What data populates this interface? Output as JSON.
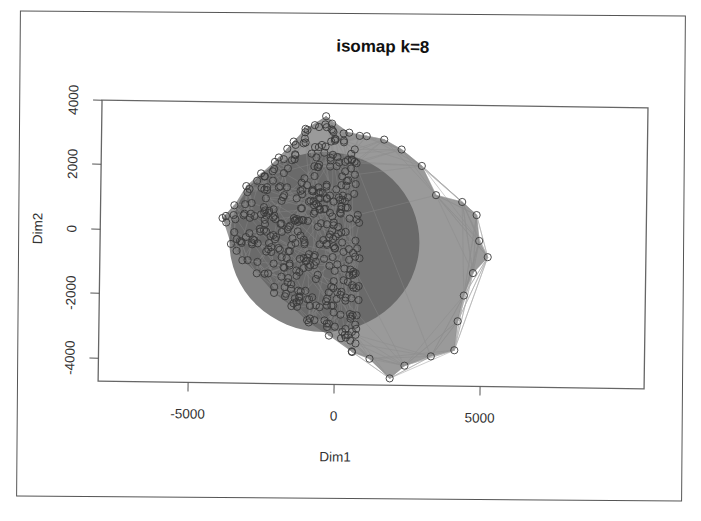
{
  "chart_data": {
    "type": "scatter",
    "subtype": "network-graph-scatter",
    "title": "isomap k=8",
    "xlabel": "Dim1",
    "ylabel": "Dim2",
    "xlim": [
      -8000,
      10000
    ],
    "ylim": [
      -4700,
      4100
    ],
    "x_ticks": [
      -5000,
      0,
      5000
    ],
    "x_tick_labels": [
      "-5000",
      "0",
      "5000"
    ],
    "y_ticks": [
      -4000,
      -2000,
      0,
      2000,
      4000
    ],
    "y_tick_labels": [
      "-4000",
      "-2000",
      "0",
      "2000",
      "4000"
    ],
    "grid": false,
    "legend": null,
    "point_style": "open circles, dark gray",
    "edge_style": "gray line segments connecting k=8 nearest neighbors",
    "hull_points": [
      {
        "x": -3900,
        "y": 400
      },
      {
        "x": -3500,
        "y": 800
      },
      {
        "x": -3100,
        "y": 1400
      },
      {
        "x": -2600,
        "y": 1800
      },
      {
        "x": -2000,
        "y": 2300
      },
      {
        "x": -1500,
        "y": 2800
      },
      {
        "x": -1100,
        "y": 3200
      },
      {
        "x": -400,
        "y": 3600
      },
      {
        "x": 400,
        "y": 3100
      },
      {
        "x": 1000,
        "y": 3000
      },
      {
        "x": 1600,
        "y": 2900
      },
      {
        "x": 2200,
        "y": 2600
      },
      {
        "x": 2900,
        "y": 2100
      },
      {
        "x": 3400,
        "y": 1200
      },
      {
        "x": 4300,
        "y": 1000
      },
      {
        "x": 4800,
        "y": 600
      },
      {
        "x": 4900,
        "y": -200
      },
      {
        "x": 5200,
        "y": -700
      },
      {
        "x": 4700,
        "y": -1200
      },
      {
        "x": 4400,
        "y": -1900
      },
      {
        "x": 4200,
        "y": -2700
      },
      {
        "x": 4100,
        "y": -3600
      },
      {
        "x": 3300,
        "y": -3800
      },
      {
        "x": 2400,
        "y": -4100
      },
      {
        "x": 1900,
        "y": -4500
      },
      {
        "x": 1200,
        "y": -3900
      },
      {
        "x": 600,
        "y": -3700
      },
      {
        "x": -200,
        "y": -3200
      },
      {
        "x": -900,
        "y": -2800
      },
      {
        "x": -1500,
        "y": -2300
      },
      {
        "x": -2100,
        "y": -1900
      },
      {
        "x": -2700,
        "y": -1300
      },
      {
        "x": -3200,
        "y": -900
      },
      {
        "x": -3600,
        "y": -400
      }
    ],
    "n_points_approx": 400,
    "density_note": "dense dark core centered near (0, 0); sparser edges toward lower-right"
  },
  "plot": {
    "title": "isomap k=8",
    "xlabel": "Dim1",
    "ylabel": "Dim2",
    "x_tick_labels": [
      "-5000",
      "0",
      "5000"
    ],
    "y_tick_labels": [
      "4000",
      "2000",
      "0",
      "-2000",
      "-4000"
    ]
  },
  "colors": {
    "background": "#ffffff",
    "axes": "#555555",
    "edge": "#8a8a8a",
    "core": "#5a5a5a",
    "point": "#3a3a3a"
  }
}
